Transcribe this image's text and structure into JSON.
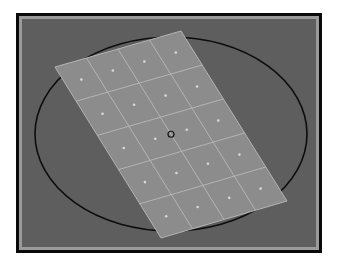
{
  "viewport": {
    "background_color": "#5e5e5e",
    "frame_color": "#0a0a0a",
    "bevel_color": "#9a9a9a"
  },
  "ellipse": {
    "cx": 171,
    "cy": 134,
    "rx": 136,
    "ry": 97,
    "stroke_color": "#0d0d0d"
  },
  "grid": {
    "columns": 4,
    "rows": 5,
    "corners": {
      "top_left": [
        55,
        67
      ],
      "top_right": [
        181,
        31
      ],
      "bottom_right": [
        287,
        201
      ],
      "bottom_left": [
        161,
        238
      ]
    },
    "fill_color": "#8c8c8c",
    "line_color": "#b4b4b4",
    "dot_color": "#d8d8d8"
  },
  "pivot": {
    "x": 171,
    "y": 134,
    "stroke_color": "#151515"
  }
}
